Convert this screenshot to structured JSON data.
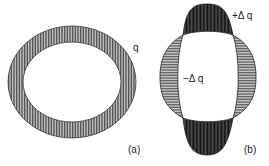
{
  "figure_a": {
    "load_label": "q",
    "caption": "(a)"
  },
  "figure_b": {
    "positive_label": "+Δ q",
    "negative_label": "−Δ q",
    "caption": "(b)"
  },
  "colors": {
    "ink": "#222222",
    "fill": "#8a8a8a"
  }
}
